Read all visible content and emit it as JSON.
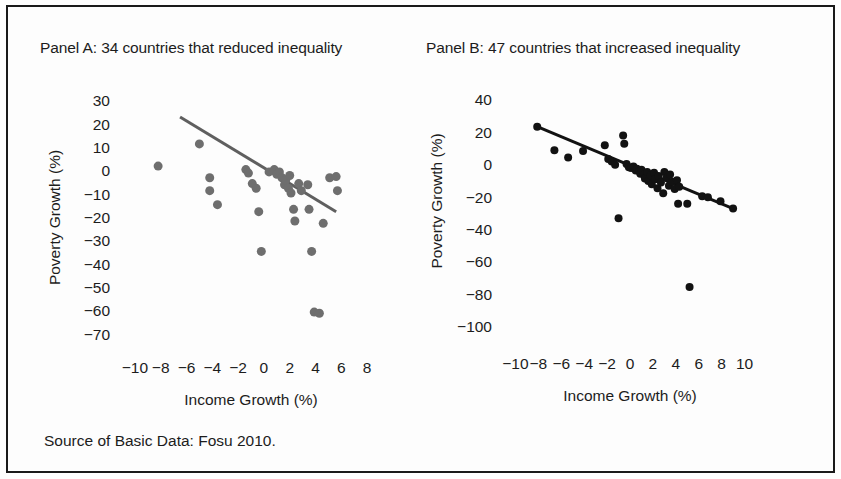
{
  "figure": {
    "source_note": "Source of Basic Data:  Fosu 2010.",
    "border_color": "#1a1a1a",
    "background": "#fdfdfd"
  },
  "panel_a": {
    "title": "Panel A: 34 countries that reduced inequality"
  },
  "panel_b": {
    "title": "Panel B: 47 countries that increased inequality"
  },
  "chart_data": [
    {
      "type": "scatter",
      "id": "panel-a",
      "title": "Panel A: 34 countries that reduced inequality",
      "xlabel": "Income Growth (%)",
      "ylabel": "Poverty Growth (%)",
      "xlim": [
        -11,
        9
      ],
      "ylim": [
        -75,
        35
      ],
      "xticks": [
        -10,
        -8,
        -6,
        -4,
        -2,
        0,
        2,
        4,
        6,
        8
      ],
      "xtick_labels": [
        "−10",
        "−8",
        "−6",
        "−4",
        "−2",
        "0",
        "2",
        "4",
        "6",
        "8"
      ],
      "yticks": [
        30,
        20,
        10,
        0,
        -10,
        -20,
        -30,
        -40,
        -50,
        -60,
        -70
      ],
      "ytick_labels": [
        "30",
        "20",
        "10",
        "0",
        "−10",
        "−20",
        "−30",
        "−40",
        "−50",
        "−60",
        "−70"
      ],
      "grid": false,
      "legend": "none",
      "marker_color": "#6e6e6e",
      "marker_size": 9,
      "trendline": {
        "color": "#5f5f5f",
        "width": 3,
        "x0": -6.5,
        "y0": 23.0,
        "x1": 5.6,
        "y1": -17.5
      },
      "points": [
        {
          "x": -8.2,
          "y": 2.0
        },
        {
          "x": -5.0,
          "y": 11.5
        },
        {
          "x": -4.2,
          "y": -3.0
        },
        {
          "x": -4.2,
          "y": -8.5
        },
        {
          "x": -3.6,
          "y": -14.5
        },
        {
          "x": -1.4,
          "y": 0.5
        },
        {
          "x": -1.2,
          "y": -1.0
        },
        {
          "x": -0.9,
          "y": -5.5
        },
        {
          "x": -0.6,
          "y": -7.5
        },
        {
          "x": -0.4,
          "y": -17.5
        },
        {
          "x": -0.2,
          "y": -34.5
        },
        {
          "x": 0.4,
          "y": -0.5
        },
        {
          "x": 0.8,
          "y": 0.5
        },
        {
          "x": 1.0,
          "y": -1.5
        },
        {
          "x": 1.2,
          "y": -0.5
        },
        {
          "x": 1.4,
          "y": -3.0
        },
        {
          "x": 1.6,
          "y": -6.0
        },
        {
          "x": 1.7,
          "y": -4.0
        },
        {
          "x": 1.9,
          "y": -7.5
        },
        {
          "x": 2.0,
          "y": -2.0
        },
        {
          "x": 2.1,
          "y": -9.5
        },
        {
          "x": 2.3,
          "y": -16.5
        },
        {
          "x": 2.4,
          "y": -21.5
        },
        {
          "x": 2.7,
          "y": -5.5
        },
        {
          "x": 2.9,
          "y": -8.5
        },
        {
          "x": 3.4,
          "y": -6.0
        },
        {
          "x": 3.5,
          "y": -16.5
        },
        {
          "x": 3.7,
          "y": -34.5
        },
        {
          "x": 3.9,
          "y": -60.5
        },
        {
          "x": 4.3,
          "y": -61.0
        },
        {
          "x": 4.6,
          "y": -22.5
        },
        {
          "x": 5.1,
          "y": -3.0
        },
        {
          "x": 5.6,
          "y": -2.5
        },
        {
          "x": 5.7,
          "y": -8.5
        }
      ]
    },
    {
      "type": "scatter",
      "id": "panel-b",
      "title": "Panel B: 47 countries that increased inequality",
      "xlabel": "Income Growth (%)",
      "ylabel": "Poverty Growth (%)",
      "xlim": [
        -11,
        11
      ],
      "ylim": [
        -110,
        48
      ],
      "xticks": [
        -10,
        -8,
        -6,
        -4,
        -2,
        0,
        2,
        4,
        6,
        8,
        10
      ],
      "xtick_labels": [
        "−10",
        "−8",
        "−6",
        "−4",
        "−2",
        "0",
        "2",
        "4",
        "6",
        "8",
        "10"
      ],
      "yticks": [
        40,
        20,
        0,
        -20,
        -40,
        -60,
        -80,
        -100
      ],
      "ytick_labels": [
        "40",
        "20",
        "0",
        "−20",
        "−40",
        "−60",
        "−80",
        "−100"
      ],
      "grid": false,
      "legend": "none",
      "marker_color": "#121212",
      "marker_size": 8,
      "trendline": {
        "color": "#121212",
        "width": 3,
        "x0": -8.1,
        "y0": 23.5,
        "x1": 9.0,
        "y1": -27.0
      },
      "points": [
        {
          "x": -8.1,
          "y": 23.5
        },
        {
          "x": -6.6,
          "y": 9.0
        },
        {
          "x": -5.4,
          "y": 4.5
        },
        {
          "x": -4.1,
          "y": 8.5
        },
        {
          "x": -2.2,
          "y": 12.0
        },
        {
          "x": -1.9,
          "y": 3.5
        },
        {
          "x": -1.6,
          "y": 2.0
        },
        {
          "x": -1.3,
          "y": 0.0
        },
        {
          "x": -1.0,
          "y": -33.0
        },
        {
          "x": -0.6,
          "y": 18.0
        },
        {
          "x": -0.5,
          "y": 13.0
        },
        {
          "x": -0.3,
          "y": 0.5
        },
        {
          "x": -0.1,
          "y": -1.5
        },
        {
          "x": 0.1,
          "y": -2.0
        },
        {
          "x": 0.3,
          "y": -1.0
        },
        {
          "x": 0.5,
          "y": -3.5
        },
        {
          "x": 0.6,
          "y": -2.5
        },
        {
          "x": 0.8,
          "y": -4.0
        },
        {
          "x": 0.9,
          "y": -5.5
        },
        {
          "x": 1.0,
          "y": -3.0
        },
        {
          "x": 1.2,
          "y": -6.0
        },
        {
          "x": 1.3,
          "y": -8.5
        },
        {
          "x": 1.5,
          "y": -4.5
        },
        {
          "x": 1.6,
          "y": -10.0
        },
        {
          "x": 1.8,
          "y": -6.5
        },
        {
          "x": 1.9,
          "y": -12.0
        },
        {
          "x": 2.1,
          "y": -5.0
        },
        {
          "x": 2.2,
          "y": -9.0
        },
        {
          "x": 2.4,
          "y": -14.5
        },
        {
          "x": 2.5,
          "y": -7.0
        },
        {
          "x": 2.7,
          "y": -11.0
        },
        {
          "x": 2.9,
          "y": -17.5
        },
        {
          "x": 3.0,
          "y": -4.5
        },
        {
          "x": 3.2,
          "y": -8.0
        },
        {
          "x": 3.4,
          "y": -13.0
        },
        {
          "x": 3.5,
          "y": -6.0
        },
        {
          "x": 3.7,
          "y": -10.5
        },
        {
          "x": 3.9,
          "y": -15.0
        },
        {
          "x": 4.1,
          "y": -9.5
        },
        {
          "x": 4.3,
          "y": -13.5
        },
        {
          "x": 4.2,
          "y": -24.0
        },
        {
          "x": 5.0,
          "y": -24.0
        },
        {
          "x": 5.2,
          "y": -75.5
        },
        {
          "x": 6.3,
          "y": -19.5
        },
        {
          "x": 6.8,
          "y": -20.0
        },
        {
          "x": 7.9,
          "y": -22.5
        },
        {
          "x": 9.0,
          "y": -27.0
        }
      ]
    }
  ]
}
